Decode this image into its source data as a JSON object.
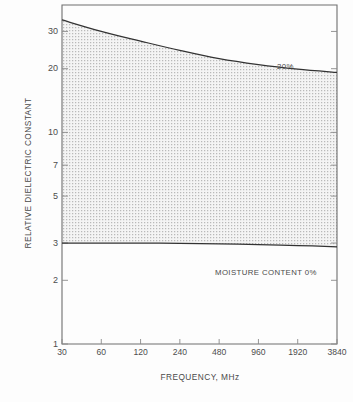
{
  "chart_data": {
    "type": "line",
    "title": "",
    "xlabel": "FREQUENCY, MHz",
    "ylabel": "RELATIVE DIELECTRIC CONSTANT",
    "xscale": "log",
    "yscale": "log",
    "xlim": [
      30,
      3840
    ],
    "ylim": [
      1,
      40
    ],
    "grid": false,
    "legend_position": "inline-annotations",
    "xticks": [
      30,
      60,
      120,
      240,
      480,
      960,
      1920,
      3840
    ],
    "xtick_labels": [
      "30",
      "60",
      "120",
      "240",
      "480",
      "960",
      "1920",
      "3840"
    ],
    "yticks": [
      1,
      2,
      3,
      5,
      7,
      10,
      20,
      30
    ],
    "ytick_labels": [
      "1",
      "2",
      "3",
      "5",
      "7",
      "10",
      "20",
      "30"
    ],
    "shaded_band": {
      "label": "moisture content range 0% to 20%",
      "fill": "stippled-dot-pattern",
      "fill_color": "#efefef",
      "between": [
        "moisture_20pct",
        "moisture_0pct"
      ]
    },
    "series": [
      {
        "name": "moisture_20pct",
        "annotation": "20%",
        "x": [
          30,
          60,
          120,
          240,
          480,
          960,
          1920,
          3840
        ],
        "y": [
          34.0,
          30.0,
          27.0,
          24.4,
          22.3,
          20.9,
          19.9,
          19.2
        ]
      },
      {
        "name": "moisture_0pct",
        "annotation": "MOISTURE CONTENT 0%",
        "x": [
          30,
          60,
          120,
          240,
          480,
          960,
          1920,
          3840
        ],
        "y": [
          3.0,
          3.0,
          3.0,
          2.99,
          2.97,
          2.95,
          2.92,
          2.88
        ]
      }
    ],
    "annotations": [
      {
        "text": "20%",
        "x": 1400,
        "y": 23.5
      },
      {
        "text": "MOISTURE CONTENT 0%",
        "x": 330,
        "y": 2.45
      }
    ],
    "colors": {
      "axis": "#6b6b6b",
      "curve": "#3a3a3a",
      "band_fill": "#efefef",
      "text": "#4a4a4a",
      "background": "#fdfdfd"
    }
  },
  "figure": {
    "caption_fragment": ""
  }
}
